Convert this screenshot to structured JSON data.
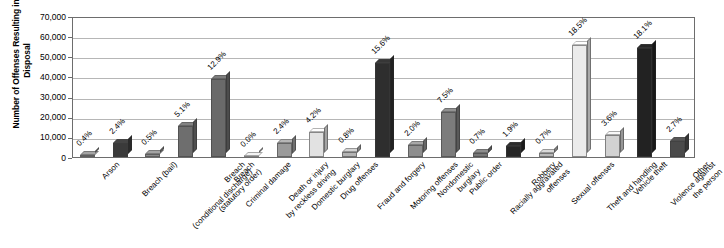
{
  "chart_data": {
    "type": "bar",
    "title": "",
    "subtitle": "",
    "xlabel": "",
    "ylabel": "Number of Offenses Resulting in a Disposal",
    "ylim": [
      0,
      70000
    ],
    "ytick_labels": [
      "70,000",
      "60,000",
      "50,000",
      "40,000",
      "30,000",
      "20,000",
      "10,000",
      "0"
    ],
    "ytick_values": [
      70000,
      60000,
      50000,
      40000,
      30000,
      20000,
      10000,
      0
    ],
    "grid": true,
    "legend": "none",
    "categories": [
      "Arson",
      "Breach (bail)",
      "Breach (conditional discharge)",
      "Breach (statutory order)",
      "Criminal damage",
      "Death or injury by reckless driving",
      "Domestic burglary",
      "Drug offenses",
      "Fraud and forgery",
      "Motoring offenses",
      "Nondomestic burglary",
      "Public order",
      "Racially aggravated offenses",
      "Robbery",
      "Sexual offenses",
      "Theft and handling",
      "Vehicle theft",
      "Violence against the person",
      "Other"
    ],
    "values": [
      1200,
      7200,
      1500,
      15300,
      38700,
      100,
      7200,
      12600,
      2400,
      46800,
      6000,
      22500,
      2100,
      5700,
      2100,
      55500,
      10800,
      54300,
      8100
    ],
    "data_labels": [
      "0.4%",
      "2.4%",
      "0.5%",
      "5.1%",
      "12.9%",
      "0.0%",
      "2.4%",
      "4.2%",
      "0.8%",
      "15.6%",
      "2.0%",
      "7.5%",
      "0.7%",
      "1.9%",
      "0.7%",
      "18.5%",
      "3.6%",
      "18.1%",
      "2.7%"
    ],
    "percentages": [
      0.4,
      2.4,
      0.5,
      5.1,
      12.9,
      0.0,
      2.4,
      4.2,
      0.8,
      15.6,
      2.0,
      7.5,
      0.7,
      1.9,
      0.7,
      18.5,
      3.6,
      18.1,
      2.7
    ],
    "bar_colors": [
      "#8c8c8c",
      "#3a3a3a",
      "#8a8a8a",
      "#6e6e6e",
      "#6a6a6a",
      "#cfcfcf",
      "#9a9a9a",
      "#e2e2e2",
      "#b4b4b4",
      "#2e2e2e",
      "#8e8e8e",
      "#7c7c7c",
      "#787878",
      "#262626",
      "#b8b8b8",
      "#ebebeb",
      "#d2d2d2",
      "#222222",
      "#4a4a4a"
    ],
    "axis_color": "#6d6d6d",
    "grid_color": "#b6b6b6",
    "plot_background": "#ffffff"
  }
}
